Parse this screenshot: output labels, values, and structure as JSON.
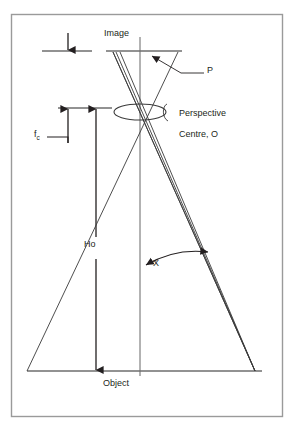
{
  "figure": {
    "kind": "optics-ray-diagram",
    "title_visible": false,
    "colors": {
      "frame": "#9a9a9a",
      "line": "#3a3a3a",
      "plane_line": "#6e6e6e",
      "text": "#231f20",
      "background": "#ffffff"
    },
    "frame": {
      "x": 11,
      "y": 14,
      "width": 272,
      "height": 403
    }
  },
  "labels": {
    "image_plane": "Image",
    "object_plane": "Object",
    "point_p": "P",
    "perspective_centre_line1": "Perspective",
    "perspective_centre_line2": "Centre, O",
    "focal_length": "f",
    "focal_length_sub": "c",
    "object_height": "Ho",
    "angle": "X"
  },
  "geometry": {
    "image_plane_y": 51,
    "lens_plane_y": 108,
    "object_plane_y": 371,
    "optical_axis_x": 140,
    "image_point_x": 113,
    "object_point_x": 255,
    "lens_centre": {
      "x": 140,
      "y": 112
    },
    "lens_rx": 26,
    "lens_ry": 8,
    "image_plane_span": [
      106,
      182
    ],
    "object_plane_span": [
      27,
      262
    ],
    "fc_tick_top_y": 51,
    "fc_tick_bottom_y": 108,
    "fc_arrow_x": 68,
    "ho_arrow_x": 96,
    "ho_top_y": 108,
    "ho_bottom_y": 371,
    "ray_count": 3
  },
  "annotations": [
    {
      "name": "focal-length-dimension",
      "label": "f_c",
      "from_y": 51,
      "to_y": 108,
      "double_ended": true
    },
    {
      "name": "object-height-dimension",
      "label": "Ho",
      "from_y": 108,
      "to_y": 371,
      "double_ended": true
    },
    {
      "name": "angle-dimension",
      "label": "X",
      "double_ended": true
    },
    {
      "name": "point-p-leader",
      "label": "P"
    }
  ]
}
